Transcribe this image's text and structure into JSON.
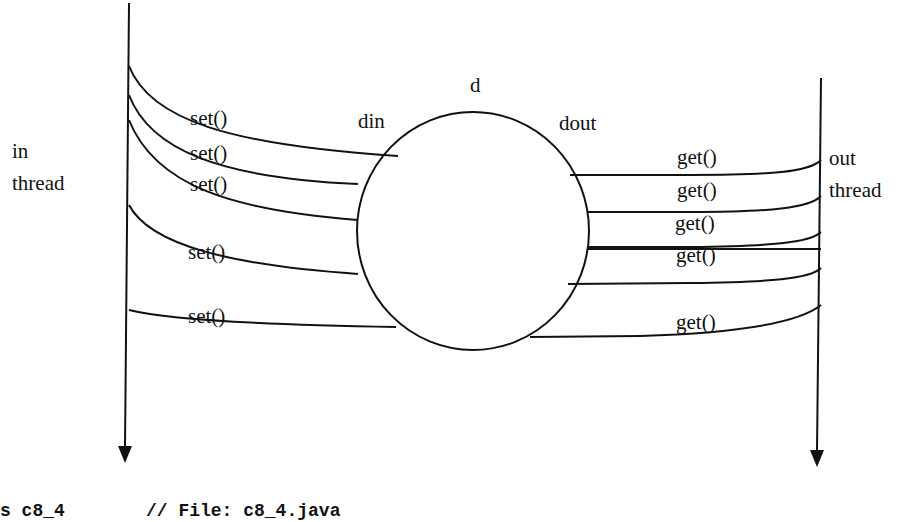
{
  "diagram": {
    "buffer": {
      "label": "d",
      "input_label": "din",
      "output_label": "dout"
    },
    "in_thread": {
      "label_line1": "in",
      "label_line2": "thread"
    },
    "out_thread": {
      "label_line1": "out",
      "label_line2": "thread"
    },
    "set_calls": [
      "set()",
      "set()",
      "set()",
      "set()",
      "set()"
    ],
    "get_calls": [
      "get()",
      "get()",
      "get()",
      "get()",
      "get()"
    ]
  },
  "code_caption": {
    "left": "s c8_4",
    "comment": "// File: c8_4.java"
  }
}
